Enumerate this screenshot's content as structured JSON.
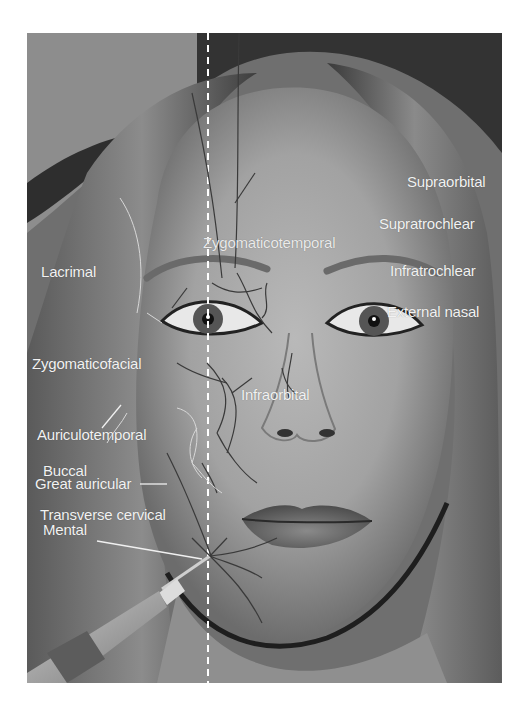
{
  "figure": {
    "midline_style": "dashed-white",
    "labels": {
      "supraorbital": "Supraorbital",
      "supratrochlear": "Supratrochlear",
      "infratrochlear": "Infratrochlear",
      "external_nasal": "External nasal",
      "lacrimal": "Lacrimal",
      "zygomaticotemporal": "Zygomaticotemporal",
      "zygomaticofacial": "Zygomaticofacial",
      "infraorbital": "Infraorbital",
      "auriculotemporal": "Auriculotemporal",
      "buccal": "Buccal",
      "great_auricular": "Great auricular",
      "transverse_cervical": "Transverse cervical",
      "mental": "Mental"
    },
    "colors": {
      "label_text": "#f2f2f2",
      "nerve_lines": "#3a3a3a",
      "light_nerve_lines": "#d8d8d8",
      "background": "#ffffff"
    }
  }
}
